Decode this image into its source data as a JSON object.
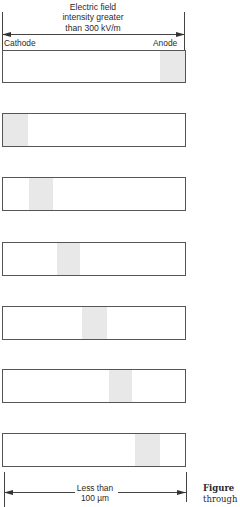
{
  "header": {
    "title_lines": [
      "Electric field",
      "intensity greater",
      "than 300 kV/m"
    ]
  },
  "labels": {
    "left_electrode": "Cathode",
    "right_electrode": "Anode"
  },
  "bars": [
    {
      "index": 1,
      "shade_start_pct": 86.5,
      "shade_width_pct": 13.5
    },
    {
      "index": 2,
      "shade_start_pct": 0,
      "shade_width_pct": 13.5
    },
    {
      "index": 3,
      "shade_start_pct": 14.5,
      "shade_width_pct": 13
    },
    {
      "index": 4,
      "shade_start_pct": 29.5,
      "shade_width_pct": 13
    },
    {
      "index": 5,
      "shade_start_pct": 43.5,
      "shade_width_pct": 13.5
    },
    {
      "index": 6,
      "shade_start_pct": 58,
      "shade_width_pct": 13
    },
    {
      "index": 7,
      "shade_start_pct": 72.5,
      "shade_width_pct": 13.5
    }
  ],
  "footer": {
    "dimension_lines": [
      "Less than",
      "100 µm"
    ],
    "caption_lines": [
      "Figure",
      "through"
    ]
  }
}
